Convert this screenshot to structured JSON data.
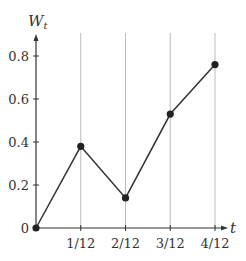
{
  "chart_data": {
    "type": "line",
    "title": "",
    "xlabel": "t",
    "ylabel": "W",
    "ylabel_subscript": "t",
    "x": [
      0,
      0.0833,
      0.1667,
      0.25,
      0.3333
    ],
    "x_tick_labels": [
      "1/12",
      "2/12",
      "3/12",
      "4/12"
    ],
    "x_tick_values": [
      0.0833,
      0.1667,
      0.25,
      0.3333
    ],
    "y_tick_labels": [
      "0",
      "0.2",
      "0.4",
      "0.6",
      "0.8"
    ],
    "y_tick_values": [
      0,
      0.2,
      0.4,
      0.6,
      0.8
    ],
    "series": [
      {
        "name": "W_t",
        "values": [
          0,
          0.38,
          0.14,
          0.53,
          0.76
        ]
      }
    ],
    "xlim": [
      0,
      0.3333
    ],
    "ylim": [
      0,
      0.9
    ],
    "grid": "vertical lines at x ticks",
    "legend": "none",
    "markers": "filled circles",
    "colors": {
      "line": "#333333",
      "grid": "#bbbbbb",
      "axis": "#333333"
    }
  }
}
